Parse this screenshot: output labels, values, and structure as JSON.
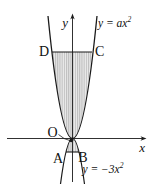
{
  "figure": {
    "axes": {
      "x_label": "x",
      "y_label": "y"
    },
    "points": {
      "D": "D",
      "C": "C",
      "A": "A",
      "B": "B",
      "origin": "O"
    },
    "equations": {
      "upper_parabola": {
        "base": "y = ax",
        "exponent": "2"
      },
      "lower_parabola": {
        "base": "y = −3x",
        "exponent": "2"
      }
    },
    "colors": {
      "line": "#1a1a1a",
      "text": "#111111",
      "hatch_light": "#ececec",
      "hatch_dark": "#bdbdbd",
      "background": "#ffffff"
    }
  }
}
